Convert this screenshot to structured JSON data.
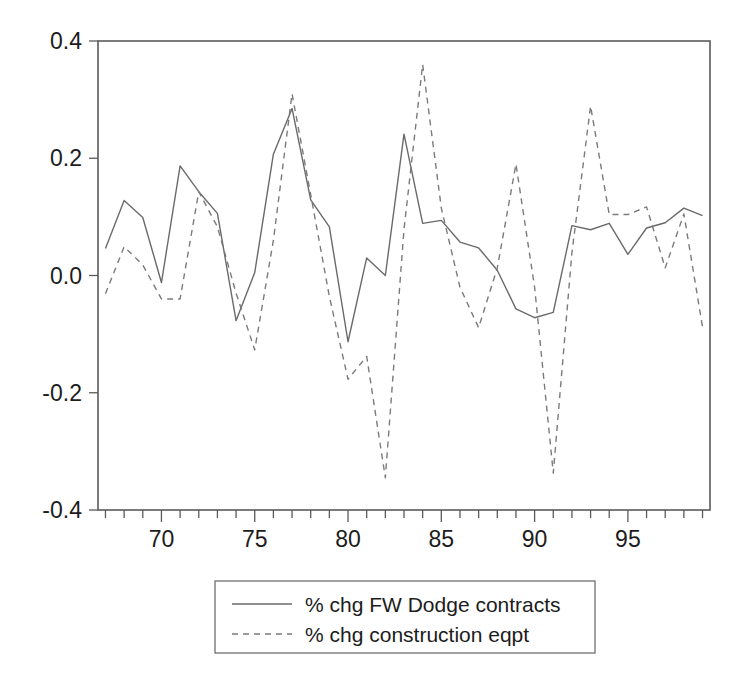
{
  "chart_data": {
    "type": "line",
    "title": "",
    "subtitle": "",
    "xlabel": "",
    "ylabel": "",
    "xlim": [
      66.6,
      99.4
    ],
    "ylim": [
      -0.4,
      0.4
    ],
    "grid": false,
    "legend_position": "bottom-center",
    "y_ticks": [
      "0.4",
      "0.2",
      "0.0",
      "-0.2",
      "-0.4"
    ],
    "y_tick_values": [
      0.4,
      0.2,
      0.0,
      -0.2,
      -0.4
    ],
    "x_ticks": [
      "70",
      "75",
      "80",
      "85",
      "90",
      "95"
    ],
    "x_tick_values": [
      70,
      75,
      80,
      85,
      90,
      95
    ],
    "x_minor_tick_values": [
      67,
      68,
      69,
      71,
      72,
      73,
      74,
      76,
      77,
      78,
      79,
      81,
      82,
      83,
      84,
      86,
      87,
      88,
      89,
      91,
      92,
      93,
      94,
      96,
      97,
      98,
      99
    ],
    "x": [
      67,
      68,
      69,
      70,
      71,
      72,
      73,
      74,
      75,
      76,
      77,
      78,
      79,
      80,
      81,
      82,
      83,
      84,
      85,
      86,
      87,
      88,
      89,
      90,
      91,
      92,
      93,
      94,
      95,
      96,
      97,
      98,
      99
    ],
    "series": [
      {
        "name": "% chg FW Dodge contracts",
        "style": "solid",
        "color": "#6a6a6a",
        "values": [
          0.046,
          0.128,
          0.099,
          -0.012,
          0.187,
          0.143,
          0.106,
          -0.077,
          0.005,
          0.207,
          0.285,
          0.129,
          0.083,
          -0.113,
          0.03,
          0.0,
          0.241,
          0.089,
          0.094,
          0.057,
          0.047,
          0.009,
          -0.057,
          -0.072,
          -0.063,
          0.085,
          0.078,
          0.089,
          0.036,
          0.081,
          0.09,
          0.115,
          0.102
        ]
      },
      {
        "name": "% chg construction eqpt",
        "style": "dashed",
        "color": "#7b7b7b",
        "values": [
          -0.031,
          0.049,
          0.018,
          -0.04,
          -0.04,
          0.143,
          0.083,
          -0.03,
          -0.127,
          0.06,
          0.31,
          0.138,
          -0.036,
          -0.177,
          -0.138,
          -0.345,
          0.079,
          0.36,
          0.115,
          -0.02,
          -0.089,
          0.013,
          0.19,
          -0.02,
          -0.337,
          0.039,
          0.289,
          0.104,
          0.104,
          0.117,
          0.013,
          0.105,
          -0.088
        ]
      }
    ]
  },
  "legend": {
    "entries": [
      {
        "label": "% chg FW Dodge contracts",
        "style": "solid"
      },
      {
        "label": "% chg construction eqpt",
        "style": "dashed"
      }
    ]
  }
}
